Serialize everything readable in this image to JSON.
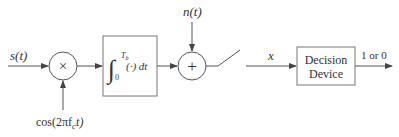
{
  "diagram": {
    "type": "block-diagram",
    "colors": {
      "stroke": "#555555",
      "text": "#333333",
      "box_stroke": "#777777",
      "background": "#ffffff"
    },
    "inputs": {
      "signal_label": "s(t)",
      "carrier_label": "cos(2πf",
      "carrier_sub": "c",
      "carrier_tail": "t)",
      "noise_label": "n(t)"
    },
    "blocks": {
      "multiplier": {
        "symbol": "×"
      },
      "integrator": {
        "integral": "∫",
        "upper_limit": "T",
        "upper_sub": "b",
        "lower_limit": "0",
        "integrand": "(·) dt"
      },
      "adder": {
        "symbol": "+"
      },
      "decision": {
        "line1": "Decision",
        "line2": "Device"
      }
    },
    "signals": {
      "sample_label": "x",
      "output_label": "1 or 0"
    }
  }
}
